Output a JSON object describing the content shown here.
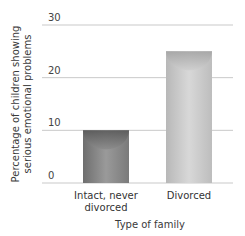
{
  "chart_data": {
    "type": "bar",
    "title": "",
    "categories": [
      "Intact, never divorced",
      "Divorced"
    ],
    "category_lines": [
      [
        "Intact, never",
        "divorced"
      ],
      [
        "Divorced"
      ]
    ],
    "values": [
      10,
      25
    ],
    "xlabel": "Type of family",
    "ylabel_lines": [
      "Percentage of children showing",
      "serious emotional problems"
    ],
    "ylabel": "Percentage of children showing serious emotional problems",
    "yticks": [
      0,
      10,
      20,
      30
    ],
    "ylim": [
      0,
      30
    ],
    "grid": true,
    "legend": null,
    "colors": {
      "bar_dark": "#8a8a8a",
      "bar_light": "#c8c8c8",
      "grid": "#c9c9c9"
    }
  }
}
